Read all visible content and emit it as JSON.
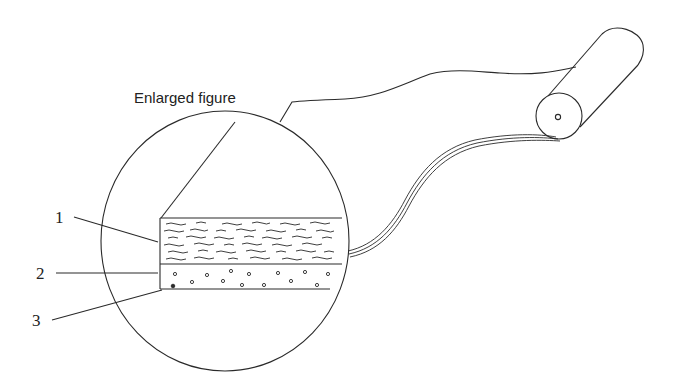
{
  "diagram": {
    "title_label": "Enlarged figure",
    "callouts": [
      {
        "number": "1",
        "target": "top fibrous layer"
      },
      {
        "number": "2",
        "target": "middle dotted layer boundary"
      },
      {
        "number": "3",
        "target": "bottom layer"
      }
    ],
    "components": [
      "magnifier-circle",
      "layered-cross-section",
      "roll",
      "sheet",
      "laminate-strip"
    ]
  }
}
